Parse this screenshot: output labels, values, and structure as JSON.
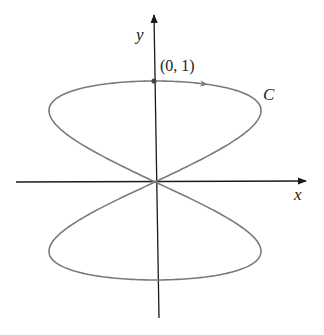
{
  "figure": {
    "axis_x_label": "x",
    "axis_y_label": "y",
    "point_label": "(0, 1)",
    "curve_label": "C",
    "colors": {
      "axis": "#1a1a1a",
      "curve": "#7a7a7a",
      "text": "#222222"
    },
    "geometry": {
      "origin": [
        155,
        182
      ],
      "scale_x": 106,
      "scale_y": 101,
      "param": "x = sin(2t), y = cos(t), t in [0, 2pi]"
    }
  }
}
